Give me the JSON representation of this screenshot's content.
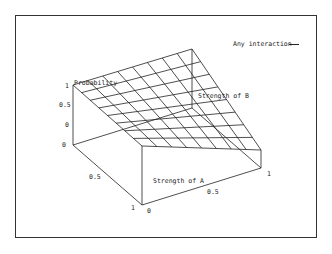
{
  "chart_data": {
    "type": "surface",
    "title": "",
    "legend": [
      {
        "label": "Any interaction",
        "style": "line",
        "color": "#222222"
      }
    ],
    "legend_position": "top-right",
    "axes": {
      "x": {
        "label": "Strength of A",
        "ticks": [
          "0",
          "0.5",
          "1"
        ],
        "range": [
          0,
          1
        ]
      },
      "y": {
        "label": "Strength of B",
        "ticks": [
          "0",
          "0.5",
          "1"
        ],
        "range": [
          0,
          1
        ]
      },
      "z": {
        "label": "Probability",
        "ticks": [
          "1",
          "0.5",
          "0",
          "0"
        ],
        "range": [
          0,
          1
        ]
      }
    },
    "grid_divisions": 8,
    "surface_description": "Planar surface; probability highest (1) at A=1,B=0 corner and decreasing linearly toward the A=0 edge",
    "corner_values": [
      {
        "A": 0,
        "B": 0,
        "P": 0.0
      },
      {
        "A": 1,
        "B": 0,
        "P": 1.0
      },
      {
        "A": 1,
        "B": 1,
        "P": 1.0
      },
      {
        "A": 0,
        "B": 1,
        "P": 0.0
      }
    ]
  },
  "labels": {
    "legend": "Any interaction",
    "z_axis": "Probability",
    "y_axis": "Strength of B",
    "x_axis": "Strength of A",
    "z_ticks": [
      "1",
      "0.5",
      "0",
      "0"
    ],
    "b_ticks": [
      "0.5",
      "1"
    ],
    "a_ticks": [
      "0",
      "0.5",
      "1"
    ]
  }
}
